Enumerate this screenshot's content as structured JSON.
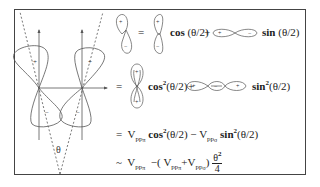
{
  "diagram": {
    "left_figure": {
      "angle_label": "θ",
      "lobe_signs": {
        "upper_left": "+",
        "upper_right": "+",
        "lower_left": "−",
        "lower_right": "−"
      }
    },
    "equations": [
      {
        "lhs_orbital": "p-orbital tilted (+ up, − down)",
        "eq": "=",
        "term1_orbital": "vertical p-orbital (+ top, − bottom)",
        "term1_func": "cos",
        "term1_arg": "(θ/2)",
        "op": "+",
        "term2_orbital": "horizontal p-orbital (+ left, − right)",
        "term2_func": "sin",
        "term2_arg": "(θ/2)"
      },
      {
        "eq": "=",
        "term1_orbital": "stacked vertical pair (+,+ top / +,+ bottom)",
        "term1_func": "cos",
        "term1_exp": "2",
        "term1_arg": "(θ/2)",
        "op": "+",
        "term2_orbital": "horizontal chain (+, −, +)",
        "term2_func": "sin",
        "term2_exp": "2",
        "term2_arg": "(θ/2)"
      },
      {
        "eq": "=",
        "v1": "V",
        "v1_sub": "pp",
        "v1_subsub": "π",
        "f1": "cos",
        "f1_exp": "2",
        "f1_arg": "(θ/2)",
        "op": "−",
        "v2": "V",
        "v2_sub": "pp",
        "v2_subsub": "σ",
        "f2": "sin",
        "f2_exp": "2",
        "f2_arg": "(θ/2)"
      },
      {
        "eq": "~",
        "v1": "V",
        "v1_sub": "pp",
        "v1_subsub": "π",
        "minus": "−(",
        "inner_v1": "V",
        "inner_v1_sub": "pp",
        "inner_v1_subsub": "π",
        "plus": "+",
        "inner_v2": "V",
        "inner_v2_sub": "pp",
        "inner_v2_subsub": "σ",
        "close": ")",
        "frac_num": "θ",
        "frac_num_exp": "2",
        "frac_den": "4"
      }
    ],
    "glyph_signs": {
      "plus": "+",
      "minus": "−"
    }
  }
}
